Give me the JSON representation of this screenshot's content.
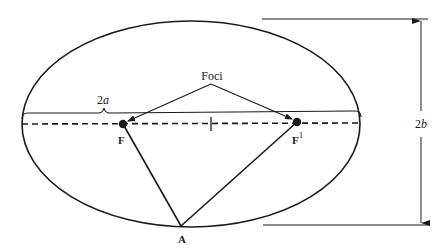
{
  "diagram": {
    "type": "ellipse-geometry",
    "colors": {
      "line": "#1a1a1a",
      "background": "#ffffff"
    },
    "ellipse": {
      "cx": 191,
      "cy": 124,
      "rx": 169,
      "ry": 103
    },
    "labels": {
      "foci": "Foci",
      "major_axis": "2a",
      "major_axis_var": "a",
      "major_axis_coef": "2",
      "minor_axis_coef": "2",
      "minor_axis_var": "b",
      "focus_left": "F",
      "focus_right": "F",
      "focus_right_sup": "1",
      "point_a": "A"
    },
    "points": {
      "F": {
        "x": 123,
        "y": 124
      },
      "F1": {
        "x": 297,
        "y": 122
      },
      "A": {
        "x": 181,
        "y": 226
      },
      "center": {
        "x": 211,
        "y": 124
      }
    }
  }
}
